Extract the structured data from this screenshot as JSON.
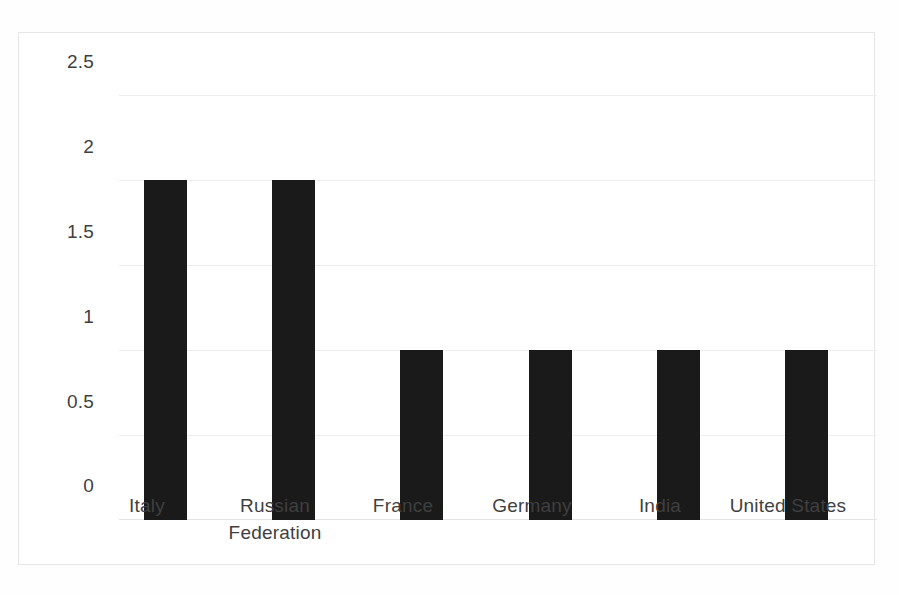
{
  "chart_data": {
    "type": "bar",
    "title": "",
    "subtitle": "",
    "xlabel": "",
    "ylabel": "",
    "categories": [
      "Italy",
      "Russian Federation",
      "France",
      "Germany",
      "India",
      "United States"
    ],
    "values": [
      2,
      2,
      1,
      1,
      1,
      1
    ],
    "series": [
      {
        "name": "",
        "values": [
          2,
          2,
          1,
          1,
          1,
          1
        ]
      }
    ],
    "ylim": [
      0,
      2.5
    ],
    "y_ticks": [
      "0",
      "0.5",
      "1",
      "1.5",
      "2",
      "2.5"
    ],
    "y_tick_values": [
      0,
      0.5,
      1,
      1.5,
      2,
      2.5
    ],
    "grid": true,
    "grid_axis": "y",
    "legend": false,
    "legend_position": "none",
    "bar_color": "#1a1a1a",
    "gridline_color": "#eeeeee",
    "plot_border_color": "#e6e6e6",
    "background_color": "#ffffff",
    "tick_label_color": "#3f3f3f"
  }
}
